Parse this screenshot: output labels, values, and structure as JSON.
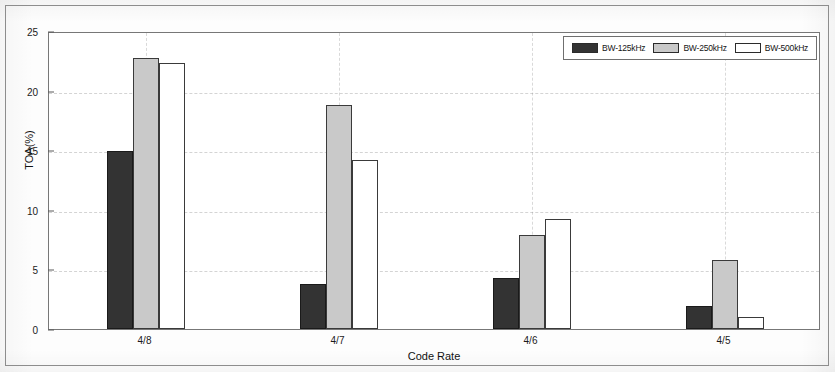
{
  "chart_data": {
    "type": "bar",
    "title": "",
    "xlabel": "Code Rate",
    "ylabel": "TOA(%)",
    "categories": [
      "4/8",
      "4/7",
      "4/6",
      "4/5"
    ],
    "series": [
      {
        "name": "BW-125kHz",
        "color": "#333333",
        "values": [
          14.9,
          3.8,
          4.3,
          1.9
        ]
      },
      {
        "name": "BW-250kHz",
        "color": "#c9c9c9",
        "values": [
          22.7,
          18.8,
          7.9,
          5.8
        ]
      },
      {
        "name": "BW-500kHz",
        "color": "#ffffff",
        "values": [
          22.3,
          14.2,
          9.2,
          1.0
        ]
      }
    ],
    "ylim": [
      0,
      25
    ],
    "yticks": [
      0,
      5,
      10,
      15,
      20,
      25
    ],
    "grid": true,
    "legend_position": "top-right"
  },
  "legend": {
    "entries": [
      {
        "label": "BW-125kHz"
      },
      {
        "label": "BW-250kHz"
      },
      {
        "label": "BW-500kHz"
      }
    ]
  },
  "axes": {
    "y_title": "TOA(%)",
    "x_title": "Code Rate",
    "y_ticks": [
      "0",
      "5",
      "10",
      "15",
      "20",
      "25"
    ],
    "x_ticks": [
      "4/8",
      "4/7",
      "4/6",
      "4/5"
    ]
  }
}
